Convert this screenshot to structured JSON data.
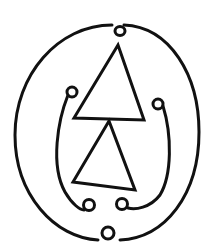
{
  "figure": {
    "colors": {
      "stroke": "#111111",
      "background": "#ffffff"
    }
  }
}
